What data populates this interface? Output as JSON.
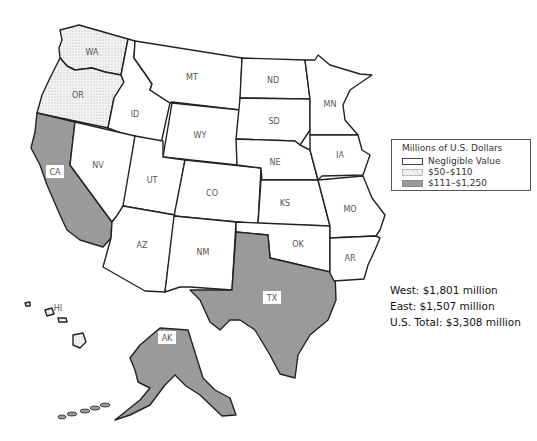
{
  "title": "",
  "legend": {
    "title": "Millions of U.S. Dollars",
    "categories": [
      {
        "key": "negligible",
        "label": "Negligible Value",
        "color": "#ffffff",
        "pattern": "none"
      },
      {
        "key": "low",
        "label": "$50–$110",
        "color": "#efefef",
        "pattern": "dots"
      },
      {
        "key": "high",
        "label": "$111–$1,250",
        "color": "#9a9a9a",
        "pattern": "solid"
      }
    ]
  },
  "states": [
    {
      "abbr": "WA",
      "category": "low"
    },
    {
      "abbr": "OR",
      "category": "low"
    },
    {
      "abbr": "CA",
      "category": "high"
    },
    {
      "abbr": "ID",
      "category": "negligible"
    },
    {
      "abbr": "NV",
      "category": "negligible"
    },
    {
      "abbr": "MT",
      "category": "negligible"
    },
    {
      "abbr": "WY",
      "category": "negligible"
    },
    {
      "abbr": "UT",
      "category": "negligible"
    },
    {
      "abbr": "CO",
      "category": "negligible"
    },
    {
      "abbr": "AZ",
      "category": "negligible"
    },
    {
      "abbr": "NM",
      "category": "negligible"
    },
    {
      "abbr": "ND",
      "category": "negligible"
    },
    {
      "abbr": "SD",
      "category": "negligible"
    },
    {
      "abbr": "NE",
      "category": "negligible"
    },
    {
      "abbr": "KS",
      "category": "negligible"
    },
    {
      "abbr": "OK",
      "category": "negligible"
    },
    {
      "abbr": "TX",
      "category": "high"
    },
    {
      "abbr": "MN",
      "category": "negligible"
    },
    {
      "abbr": "IA",
      "category": "negligible"
    },
    {
      "abbr": "MO",
      "category": "negligible"
    },
    {
      "abbr": "AR",
      "category": "negligible"
    },
    {
      "abbr": "AK",
      "category": "high"
    },
    {
      "abbr": "HI",
      "category": "low"
    }
  ],
  "totals": {
    "west": "West: $1,801 million",
    "east": "East: $1,507 million",
    "us_total": "U.S. Total: $3,308 million"
  }
}
